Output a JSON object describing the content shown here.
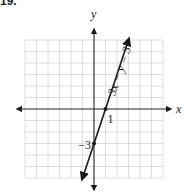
{
  "problem_number": "19.",
  "chart_data": {
    "type": "line",
    "title": "",
    "xlabel": "x",
    "ylabel": "y",
    "xlim": [
      -6,
      6
    ],
    "ylim": [
      -6,
      6
    ],
    "grid": true,
    "series": [
      {
        "name": "3x − y = 3",
        "equation": "3x − y = 3",
        "x": [
          -1,
          3
        ],
        "y": [
          -6,
          6
        ]
      }
    ],
    "points": [
      {
        "x": 1,
        "y": 0,
        "label": "1"
      },
      {
        "x": 0,
        "y": -3,
        "label": "−3"
      }
    ],
    "annotations": [
      {
        "text": "3x − y = 3",
        "near": "line upper-right, rotated along line"
      }
    ]
  }
}
